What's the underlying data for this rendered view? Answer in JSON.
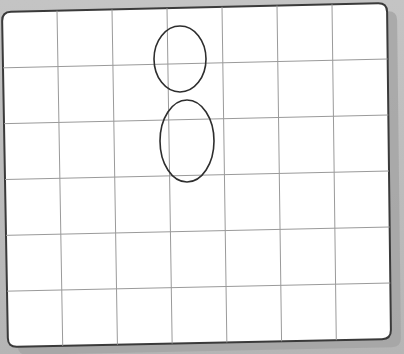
{
  "scene": {
    "description": "Photo of a white grid board with two hand-drawn ellipses",
    "background_color": "#b9b9b9",
    "board_color": "#ffffff",
    "border_color": "#3a3a3a",
    "grid_color": "#9a9a9a",
    "ellipse_color": "#2e2e2e"
  },
  "board": {
    "corners": {
      "top_left": [
        2,
        12
      ],
      "top_right": [
        387,
        3
      ],
      "bottom_right": [
        391,
        339
      ],
      "bottom_left": [
        8,
        347
      ]
    },
    "columns": 7,
    "rows": 6
  },
  "shapes": [
    {
      "type": "ellipse",
      "name": "upper-ellipse",
      "cx": 180,
      "cy": 59,
      "rx": 26,
      "ry": 33
    },
    {
      "type": "ellipse",
      "name": "lower-ellipse",
      "cx": 187,
      "cy": 141,
      "rx": 27,
      "ry": 41
    }
  ]
}
